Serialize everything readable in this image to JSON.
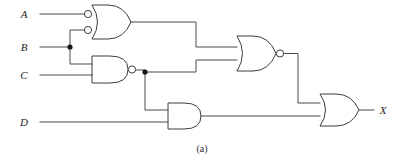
{
  "figure": {
    "caption": "(a)",
    "colors": {
      "wire": "#4a4a52",
      "gate_outline": "#3c3c44",
      "junction": "#15151a",
      "background": "#ffffff"
    }
  },
  "inputs": [
    {
      "label": "A",
      "x": 28,
      "y": 14
    },
    {
      "label": "B",
      "x": 28,
      "y": 47
    },
    {
      "label": "C",
      "x": 28,
      "y": 75
    },
    {
      "label": "D",
      "x": 28,
      "y": 122
    }
  ],
  "outputs": [
    {
      "label": "X",
      "x": 381,
      "y": 103
    }
  ],
  "gates": [
    {
      "id": "g1",
      "type": "or-negated-inputs",
      "label": "OR gate with inverted inputs",
      "inputs": [
        "A",
        "B"
      ],
      "output_to": "g3"
    },
    {
      "id": "g2",
      "type": "nand",
      "label": "NAND gate",
      "inputs": [
        "B",
        "C"
      ],
      "output_to": "g3, g4"
    },
    {
      "id": "g3",
      "type": "nor",
      "label": "NOR gate",
      "inputs": [
        "g1",
        "g2"
      ],
      "output_to": "g5"
    },
    {
      "id": "g4",
      "type": "and",
      "label": "AND gate",
      "inputs": [
        "g2",
        "D"
      ],
      "output_to": "g5"
    },
    {
      "id": "g5",
      "type": "or",
      "label": "OR gate",
      "inputs": [
        "g3",
        "g4"
      ],
      "output_to": "X"
    }
  ],
  "junctions": [
    {
      "id": "b-fanout",
      "net": "B",
      "x": 70,
      "y": 47
    },
    {
      "id": "nand-fanout",
      "net": "g2",
      "x": 145,
      "y": 72
    }
  ]
}
